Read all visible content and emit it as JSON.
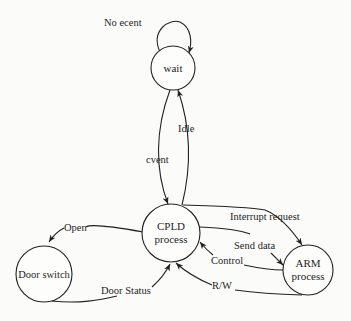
{
  "diagram": {
    "type": "state-transition",
    "nodes": [
      {
        "id": "wait",
        "label": "wait"
      },
      {
        "id": "cpld",
        "label_line1": "CPLD",
        "label_line2": "process"
      },
      {
        "id": "door",
        "label": "Door switch"
      },
      {
        "id": "arm",
        "label_line1": "ARM",
        "label_line2": "process"
      }
    ],
    "edges": [
      {
        "id": "no-event",
        "from": "wait",
        "to": "wait",
        "label": "No ecent"
      },
      {
        "id": "idle",
        "from": "cpld",
        "to": "wait",
        "label": "Idle"
      },
      {
        "id": "event",
        "from": "wait",
        "to": "cpld",
        "label": "cvent"
      },
      {
        "id": "open",
        "from": "cpld",
        "to": "door",
        "label": "Open"
      },
      {
        "id": "door-status",
        "from": "door",
        "to": "cpld",
        "label": "Door Status"
      },
      {
        "id": "interrupt",
        "from": "cpld",
        "to": "arm",
        "label": "Interrupt request"
      },
      {
        "id": "send-data",
        "from": "cpld",
        "to": "arm",
        "label": "Send data"
      },
      {
        "id": "control",
        "from": "arm",
        "to": "cpld",
        "label": "Control"
      },
      {
        "id": "rw",
        "from": "arm",
        "to": "cpld",
        "label": "R/W"
      }
    ]
  }
}
